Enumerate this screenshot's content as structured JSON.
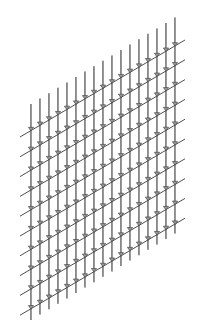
{
  "diagram": {
    "title": "",
    "colors": {
      "background": "#ffffff",
      "rod": "#6a6a6a",
      "rod_highlight": "#b0b0b0",
      "bar": "#3a3a3a",
      "clamp": "#4a4a4a"
    },
    "rods": {
      "count": 17,
      "x_start": 31,
      "x_spacing": 9,
      "top_y_start": 104,
      "bottom_y_start": 320,
      "y_shift_per_rod": -5.4
    },
    "bars": {
      "count": 10,
      "x_left": 20,
      "x_right": 185,
      "y_left_start": 137,
      "y_spacing": 19.8,
      "rise": 97
    },
    "clamp_icon": "clamp-triangle-icon"
  }
}
